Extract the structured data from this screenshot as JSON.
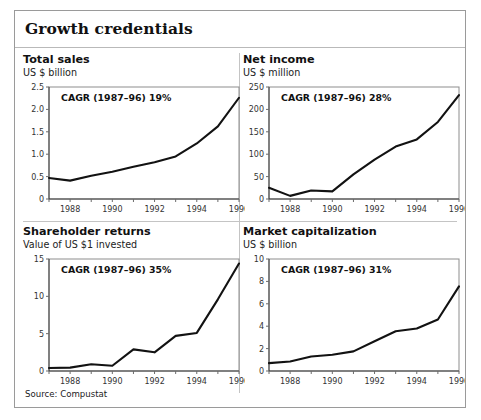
{
  "exhibit": {
    "title": "Growth credentials",
    "source": "Source: Compustat"
  },
  "chart_data": [
    {
      "type": "line",
      "title": "Total sales",
      "subtitle": "US $ billion",
      "annotation": "CAGR (1987–96) 19%",
      "xlabel": "",
      "ylabel": "US $ billion",
      "x": [
        1987,
        1988,
        1989,
        1990,
        1991,
        1992,
        1993,
        1994,
        1995,
        1996
      ],
      "xticklabels": [
        "1988",
        "1990",
        "1992",
        "1994",
        "1996"
      ],
      "xtickvalues": [
        1988,
        1990,
        1992,
        1994,
        1996
      ],
      "values": [
        0.47,
        0.41,
        0.52,
        0.61,
        0.72,
        0.82,
        0.95,
        1.24,
        1.62,
        2.26
      ],
      "yticks": [
        0,
        0.5,
        1.0,
        1.5,
        2.0,
        2.5
      ],
      "yticklabels": [
        "0",
        "0.5",
        "1.0",
        "1.5",
        "2.0",
        "2.5"
      ],
      "ylim": [
        0,
        2.5
      ],
      "xlim": [
        1987,
        1996
      ],
      "grid": false,
      "legend": "none"
    },
    {
      "type": "line",
      "title": "Net income",
      "subtitle": "US $ million",
      "annotation": "CAGR (1987–96) 28%",
      "xlabel": "",
      "ylabel": "US $ million",
      "x": [
        1987,
        1988,
        1989,
        1990,
        1991,
        1992,
        1993,
        1994,
        1995,
        1996
      ],
      "xticklabels": [
        "1988",
        "1990",
        "1992",
        "1994",
        "1996"
      ],
      "xtickvalues": [
        1988,
        1990,
        1992,
        1994,
        1996
      ],
      "values": [
        25,
        7,
        19,
        17,
        55,
        88,
        117,
        133,
        172,
        232
      ],
      "yticks": [
        0,
        50,
        100,
        150,
        200,
        250
      ],
      "yticklabels": [
        "0",
        "50",
        "100",
        "150",
        "200",
        "250"
      ],
      "ylim": [
        0,
        250
      ],
      "xlim": [
        1987,
        1996
      ],
      "grid": false,
      "legend": "none"
    },
    {
      "type": "line",
      "title": "Shareholder returns",
      "subtitle": "Value of US $1 invested",
      "annotation": "CAGR (1987–96) 35%",
      "xlabel": "",
      "ylabel": "Value of US $1 invested",
      "x": [
        1987,
        1988,
        1989,
        1990,
        1991,
        1992,
        1993,
        1994,
        1995,
        1996
      ],
      "xticklabels": [
        "1988",
        "1990",
        "1992",
        "1994",
        "1996"
      ],
      "xtickvalues": [
        1988,
        1990,
        1992,
        1994,
        1996
      ],
      "values": [
        0.4,
        0.45,
        0.9,
        0.7,
        2.9,
        2.5,
        4.7,
        5.1,
        9.6,
        14.4
      ],
      "yticks": [
        0,
        5,
        10,
        15
      ],
      "yticklabels": [
        "0",
        "5",
        "10",
        "15"
      ],
      "ylim": [
        0,
        15
      ],
      "xlim": [
        1987,
        1996
      ],
      "grid": false,
      "legend": "none"
    },
    {
      "type": "line",
      "title": "Market capitalization",
      "subtitle": "US $ billion",
      "annotation": "CAGR (1987–96) 31%",
      "xlabel": "",
      "ylabel": "US $ billion",
      "x": [
        1987,
        1988,
        1989,
        1990,
        1991,
        1992,
        1993,
        1994,
        1995,
        1996
      ],
      "xticklabels": [
        "1988",
        "1990",
        "1992",
        "1994",
        "1996"
      ],
      "xtickvalues": [
        1988,
        1990,
        1992,
        1994,
        1996
      ],
      "values": [
        0.7,
        0.85,
        1.3,
        1.45,
        1.75,
        2.65,
        3.55,
        3.8,
        4.6,
        7.55
      ],
      "yticks": [
        0,
        2,
        4,
        6,
        8,
        10
      ],
      "yticklabels": [
        "0",
        "2",
        "4",
        "6",
        "8",
        "10"
      ],
      "ylim": [
        0,
        10
      ],
      "xlim": [
        1987,
        1996
      ],
      "grid": false,
      "legend": "none"
    }
  ]
}
